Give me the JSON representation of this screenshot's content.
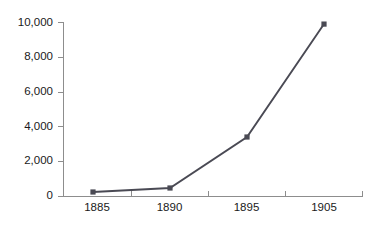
{
  "chart_data": {
    "type": "line",
    "title": "",
    "subtitle": "",
    "xlabel": "",
    "ylabel": "",
    "categories": [
      "1885",
      "1890",
      "1895",
      "1905"
    ],
    "values": [
      230,
      460,
      3390,
      9880
    ],
    "series": [
      {
        "name": "",
        "values": [
          230,
          460,
          3390,
          9880
        ]
      }
    ],
    "x_tick_labels": [
      "1885",
      "1890",
      "1895",
      "1905"
    ],
    "y_tick_labels": [
      "0",
      "2,000",
      "4,000",
      "6,000",
      "8,000",
      "10,000"
    ],
    "y_tick_values": [
      0,
      2000,
      4000,
      6000,
      8000,
      10000
    ],
    "ylim": [
      0,
      10000
    ],
    "grid": false,
    "legend": false,
    "legend_position": "none",
    "marker": "square",
    "line_color": "#4a4a54",
    "marker_color": "#4a4a54",
    "axis_color": "#8d8d8d",
    "text_color": "#1a1a1a",
    "background_color": "#ffffff"
  },
  "axes": {
    "plot_left": 63,
    "plot_right": 363,
    "plot_top": 22,
    "plot_bottom": 196,
    "x_tick_positions": [
      63,
      131,
      208,
      285,
      363
    ],
    "x_label_positions": [
      97,
      169.5,
      246.5,
      324
    ],
    "point_x_positions": [
      93,
      170,
      247,
      324
    ]
  }
}
